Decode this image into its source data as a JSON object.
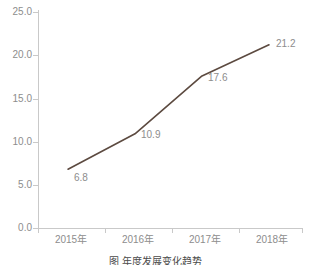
{
  "chart_data": {
    "type": "line",
    "title": "",
    "subtitle": "",
    "xlabel": "",
    "ylabel": "",
    "categories": [
      "2015年",
      "2016年",
      "2017年",
      "2018年"
    ],
    "values": [
      6.8,
      10.9,
      17.6,
      21.2
    ],
    "series": [
      {
        "name": "",
        "values": [
          6.8,
          10.9,
          17.6,
          21.2
        ]
      }
    ],
    "point_labels": [
      "6.8",
      "10.9",
      "17.6",
      "21.2"
    ],
    "ylim": [
      0.0,
      25.0
    ],
    "ytick_values": [
      0.0,
      5.0,
      10.0,
      15.0,
      20.0,
      25.0
    ],
    "ytick_labels": [
      "0.0",
      "5.0",
      "10.0",
      "15.0",
      "20.0",
      "25.0"
    ],
    "xtick_labels": [
      "2015年",
      "2016年",
      "2017年",
      "2018年"
    ],
    "grid": false,
    "legend": false,
    "legend_position": "none",
    "line_color": "#5c4a40",
    "axis_color": "#c9c9c9",
    "tick_label_color": "#8d8d8d",
    "background_color": "#ffffff"
  },
  "axis": {
    "y_labels": [
      "25.0",
      "20.0",
      "15.0",
      "10.0",
      "5.0",
      "0.0"
    ],
    "x_labels": [
      "2015年",
      "2016年",
      "2017年",
      "2018年"
    ]
  },
  "labels": {
    "p0": "6.8",
    "p1": "10.9",
    "p2": "17.6",
    "p3": "21.2"
  },
  "caption": {
    "text": "图  年度发展变化趋势",
    "note": "clipped"
  }
}
